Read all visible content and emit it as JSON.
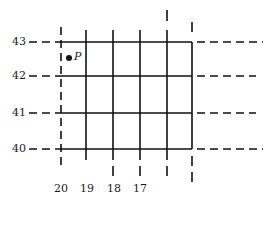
{
  "diagram": {
    "type": "grid-coordinate-diagram",
    "row_labels": [
      "43",
      "42",
      "41",
      "40"
    ],
    "column_labels": [
      "20",
      "19",
      "18",
      "17"
    ],
    "point": {
      "label": "P"
    },
    "colors": {
      "line": "#111111",
      "background": "#ffffff"
    }
  }
}
